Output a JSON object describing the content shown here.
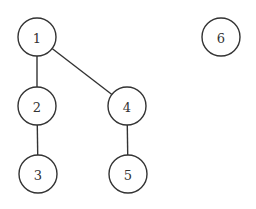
{
  "diagram": {
    "type": "graph",
    "nodes": [
      {
        "id": "1",
        "label": "1",
        "x": 37,
        "y": 37
      },
      {
        "id": "2",
        "label": "2",
        "x": 37,
        "y": 106
      },
      {
        "id": "3",
        "label": "3",
        "x": 38,
        "y": 174
      },
      {
        "id": "4",
        "label": "4",
        "x": 127,
        "y": 106
      },
      {
        "id": "5",
        "label": "5",
        "x": 128,
        "y": 174
      },
      {
        "id": "6",
        "label": "6",
        "x": 221,
        "y": 37
      }
    ],
    "edges": [
      {
        "from": "1",
        "to": "2"
      },
      {
        "from": "1",
        "to": "4"
      },
      {
        "from": "2",
        "to": "3"
      },
      {
        "from": "4",
        "to": "5"
      }
    ],
    "radius": 19,
    "colors": {
      "stroke": "#333333",
      "fill": "#ffffff",
      "background": "#ffffff"
    }
  }
}
